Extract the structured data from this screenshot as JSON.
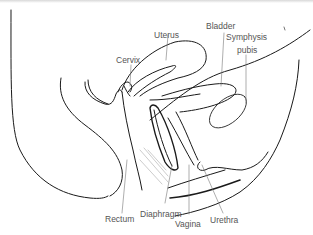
{
  "figure": {
    "type": "anatomical-diagram",
    "line_color": "#1a1a1a",
    "label_color": "#555555",
    "labels": {
      "uterus": "Uterus",
      "bladder": "Bladder",
      "symphysis": "Symphysis",
      "pubis": "pubis",
      "cervix": "Cervix",
      "rectum": "Rectum",
      "diaphragm": "Diaphragm",
      "vagina": "Vagina",
      "urethra": "Urethra"
    }
  }
}
